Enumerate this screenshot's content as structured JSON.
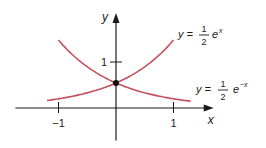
{
  "chart_data": {
    "type": "line",
    "title": "",
    "xlabel": "x",
    "ylabel": "y",
    "x_ticks": [
      {
        "value": -1,
        "label": "−1"
      },
      {
        "value": 1,
        "label": "1"
      }
    ],
    "y_ticks": [
      {
        "value": 1,
        "label": "1"
      }
    ],
    "xlim": [
      -1.75,
      1.7
    ],
    "ylim": [
      -0.65,
      1.9
    ],
    "grid": false,
    "series": [
      {
        "name": "y = 1/2 e^x",
        "function": "0.5*exp(x)",
        "x_range": [
          -1.2,
          1.0
        ],
        "color": "#c4505c"
      },
      {
        "name": "y = 1/2 e^-x",
        "function": "0.5*exp(-x)",
        "x_range": [
          -1.0,
          1.3
        ],
        "color": "#c4505c"
      }
    ],
    "annotations": [
      {
        "type": "point",
        "x": 0,
        "y": 0.5,
        "label": "intersection"
      },
      {
        "type": "label",
        "text_prefix": "y =",
        "numerator": "1",
        "denominator": "2",
        "base": "e",
        "exponent": "x",
        "anchor": "upper-right"
      },
      {
        "type": "label",
        "text_prefix": "y =",
        "numerator": "1",
        "denominator": "2",
        "base": "e",
        "exponent": "−x",
        "anchor": "lower-right"
      }
    ],
    "layout": {
      "origin_px": [
        116,
        108
      ],
      "scale_x": 57.5,
      "scale_y": 50,
      "axis_color": "#1a1a1a"
    }
  }
}
